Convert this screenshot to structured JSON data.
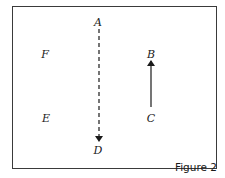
{
  "figure": {
    "caption": "Figure 2",
    "points": {
      "A": {
        "label": "A",
        "x": 98,
        "y": 22
      },
      "B": {
        "label": "B",
        "x": 151,
        "y": 54
      },
      "C": {
        "label": "C",
        "x": 151,
        "y": 118
      },
      "D": {
        "label": "D",
        "x": 98,
        "y": 151
      },
      "E": {
        "label": "E",
        "x": 46,
        "y": 118
      },
      "F": {
        "label": "F",
        "x": 45,
        "y": 54
      }
    },
    "arrows": [
      {
        "from": "A",
        "to": "D",
        "style": "dashed"
      },
      {
        "from": "C",
        "to": "B",
        "style": "solid"
      }
    ],
    "colors": {
      "ink": "#1a1a1a",
      "border": "#3a3a3a",
      "background": "#ffffff"
    }
  }
}
